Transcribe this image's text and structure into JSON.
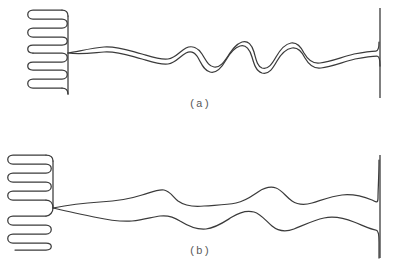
{
  "figure": {
    "background_color": "#ffffff",
    "ink_color": "#3b3b3b",
    "width": 407,
    "height": 279,
    "panels": [
      {
        "id": "a",
        "label": "(a)",
        "label_x": 189,
        "label_y": 98,
        "description": "single tightly-paired double-strand filament",
        "left_anchor_x": 68,
        "right_wall_x": 380,
        "baseline_y": 53,
        "coil": {
          "name": "serpentine-coil-a",
          "fold_count": 7,
          "x_left": 28,
          "x_right": 68,
          "y_top": 10,
          "y_bottom": 94,
          "spine_x": 68
        },
        "right_wall": {
          "x": 380,
          "y_top": 8,
          "y_bottom": 98
        },
        "strand_paths": [
          "M 68 53 C 80 51 92 48 104 47 C 118 46 130 51 142 54 C 152 57 160 60 168 59 C 176 58 180 51 186 48 C 192 45 198 48 202 54 C 206 60 208 66 214 67 C 220 68 224 62 228 56 C 232 50 236 44 242 42 C 248 40 252 45 254 52 C 256 59 257 66 262 68 C 268 70 272 64 276 57 C 280 50 285 44 291 43 C 297 42 301 47 304 53 C 308 60 313 64 320 63 C 330 62 342 57 354 54 C 364 52 372 51 376 51 C 378 51 379 47 379 42",
          "M 68 53 C 80 55 92 53 104 52 C 118 51 130 56 142 59 C 152 62 160 65 168 64 C 176 63 180 56 186 53 C 190 51 194 52 197 56 C 201 62 203 70 210 72 C 217 74 222 67 226 60 C 230 53 234 48 240 46 C 246 44 250 50 252 57 C 254 64 256 71 262 73 C 269 75 273 68 277 61 C 281 54 286 49 292 48 C 298 47 302 52 305 58 C 309 65 314 69 321 68 C 331 67 343 62 355 59 C 365 57 373 56 377 56 C 379 56 380 60 380 66"
        ]
      },
      {
        "id": "b",
        "label": "(b)",
        "label_x": 189,
        "label_y": 245,
        "description": "two separated wavy strands diverging from a common junction",
        "left_anchor_x": 53,
        "right_wall_x": 380,
        "baseline_y": 208,
        "coil": {
          "name": "serpentine-coil-b",
          "fold_count": 8,
          "x_left": 8,
          "x_right": 53,
          "y_top": 155,
          "y_bottom": 250,
          "spine_x": 53
        },
        "right_wall": {
          "x": 380,
          "y_top": 155,
          "y_bottom": 258
        },
        "strand_paths": [
          "M 53 208 C 68 205 84 203 100 202 C 116 201 130 199 142 195 C 152 192 158 189 164 190 C 170 191 173 197 178 201 C 185 206 194 207 204 206 C 216 205 226 205 236 203 C 246 201 252 196 258 192 C 264 188 270 186 276 188 C 282 190 286 197 292 201 C 298 205 305 205 312 203 C 322 200 332 196 342 195 C 352 194 362 196 372 200 C 376 202 378 204 378 198 C 378 190 379 176 379 160",
          "M 53 208 C 66 211 80 214 94 217 C 108 220 120 222 132 221 C 144 220 152 217 160 216 C 168 215 174 217 180 221 C 188 226 196 230 206 229 C 216 228 224 222 232 217 C 240 212 247 210 254 212 C 261 214 266 221 272 226 C 278 231 286 232 294 229 C 304 225 314 220 324 218 C 334 216 344 218 354 222 C 364 226 372 230 376 230 C 378 230 379 234 379 242 C 379 250 379 254 379 258"
        ]
      }
    ]
  }
}
